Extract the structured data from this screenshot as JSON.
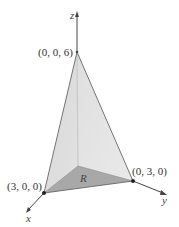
{
  "figure": {
    "type": "3d-tetrahedron-region",
    "axes": {
      "x": "x",
      "y": "y",
      "z": "z"
    },
    "vertices": [
      {
        "label": "(0, 0, 6)",
        "coords": [
          0,
          0,
          6
        ]
      },
      {
        "label": "(3, 0, 0)",
        "coords": [
          3,
          0,
          0
        ]
      },
      {
        "label": "(0, 3, 0)",
        "coords": [
          0,
          3,
          0
        ]
      }
    ],
    "region_label": "R",
    "colors": {
      "face_left": "#d3d3d3",
      "face_right": "#e4e4e4",
      "base_region": "#a9a9a9",
      "edge": "#666666",
      "axis": "#444444"
    }
  }
}
